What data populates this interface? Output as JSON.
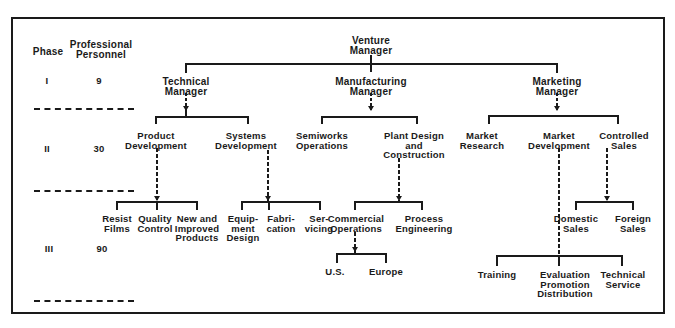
{
  "header": {
    "phase_label": "Phase",
    "personnel_label": "Professional\nPersonnel"
  },
  "phases": [
    {
      "phase": "I",
      "personnel": "9"
    },
    {
      "phase": "II",
      "personnel": "30"
    },
    {
      "phase": "III",
      "personnel": "90"
    }
  ],
  "org": {
    "venture_manager": "Venture\nManager",
    "technical": {
      "manager": "Technical\nManager",
      "product_development": "Product\nDevelopment",
      "systems_development": "Systems\nDevelopment",
      "resist_films": "Resist\nFilms",
      "quality_control": "Quality\nControl",
      "new_improved_products": "New and\nImproved\nProducts",
      "equipment_design": "Equip-\nment\nDesign",
      "fabrication": "Fabri-\ncation",
      "servicing": "Ser-\nvicing"
    },
    "manufacturing": {
      "manager": "Manufacturing\nManager",
      "semiworks_operations": "Semiworks\nOperations",
      "plant_design_construction": "Plant Design\nand\nConstruction",
      "commercial_operations": "Commercial\nOperations",
      "process_engineering": "Process\nEngineering",
      "us": "U.S.",
      "europe": "Europe"
    },
    "marketing": {
      "manager": "Marketing\nManager",
      "market_research": "Market\nResearch",
      "market_development": "Market\nDevelopment",
      "controlled_sales": "Controlled\nSales",
      "domestic_sales": "Domestic\nSales",
      "foreign_sales": "Foreign\nSales",
      "training": "Training",
      "evaluation_promotion_distribution": "Evaluation\nPromotion\nDistribution",
      "technical_service": "Technical\nService"
    }
  },
  "colors": {
    "ink": "#1a1a1a",
    "background": "#ffffff"
  }
}
